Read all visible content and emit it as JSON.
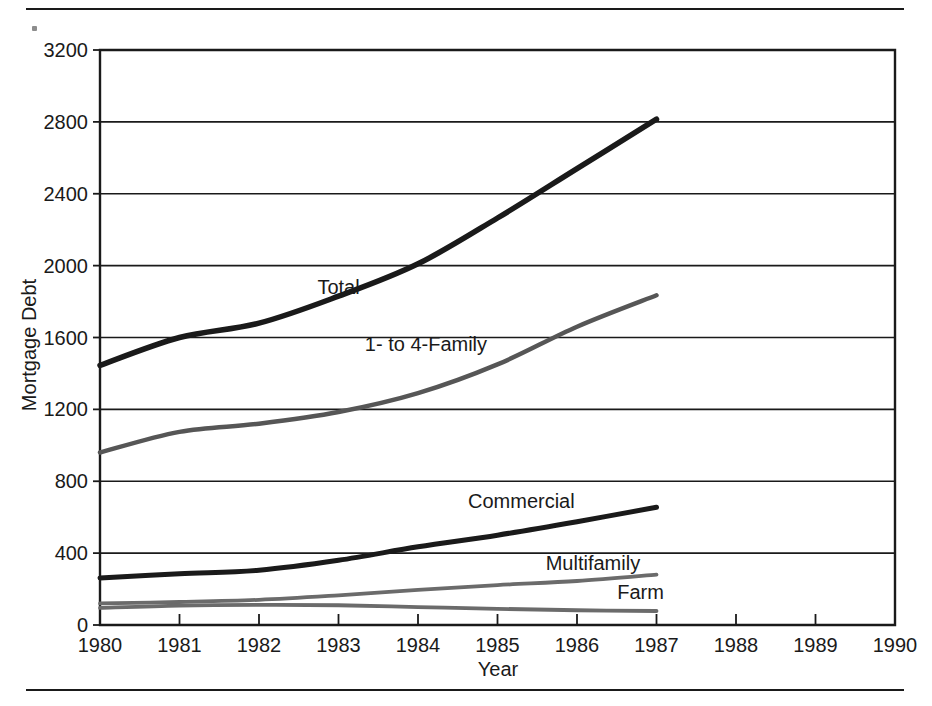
{
  "figure": {
    "rule_top": "horizontal-rule",
    "rule_bottom": "horizontal-rule",
    "speck": "print-artifact-speck"
  },
  "chart_data": {
    "type": "line",
    "title": "",
    "xlabel": "Year",
    "ylabel": "Mortgage Debt",
    "xlim": [
      1980,
      1990
    ],
    "ylim": [
      0,
      3200
    ],
    "xticks": [
      1980,
      1981,
      1982,
      1983,
      1984,
      1985,
      1986,
      1987,
      1988,
      1989,
      1990
    ],
    "xtick_labels": [
      "1980",
      "1981",
      "1982",
      "1983",
      "1984",
      "1985",
      "1986",
      "1987",
      "1988",
      "1989",
      "1990"
    ],
    "yticks": [
      0,
      400,
      800,
      1200,
      1600,
      2000,
      2400,
      2800,
      3200
    ],
    "ytick_labels": [
      "0",
      "400",
      "800",
      "1200",
      "1600",
      "2000",
      "2400",
      "2800",
      "3200"
    ],
    "grid": "horizontal",
    "legend": "inline-labels",
    "x": [
      1980,
      1981,
      1982,
      1983,
      1984,
      1985,
      1986,
      1987
    ],
    "series": [
      {
        "name": "Total",
        "label": "Total",
        "color": "#1a1a1a",
        "width": 5.5,
        "values": [
          1445,
          1600,
          1680,
          1830,
          2010,
          2265,
          2540,
          2815
        ],
        "label_x": 1983.0,
        "label_y": 1880
      },
      {
        "name": "1- to 4-Family",
        "label": "1- to 4-Family",
        "color": "#565656",
        "width": 4.5,
        "values": [
          960,
          1075,
          1120,
          1185,
          1290,
          1450,
          1660,
          1835
        ],
        "label_x": 1984.1,
        "label_y": 1565
      },
      {
        "name": "Commercial",
        "label": "Commercial",
        "color": "#1a1a1a",
        "width": 5.0,
        "values": [
          262,
          285,
          305,
          360,
          435,
          500,
          575,
          655
        ],
        "label_x": 1985.3,
        "label_y": 690
      },
      {
        "name": "Multifamily",
        "label": "Multifamily",
        "color": "#6b6b6b",
        "width": 3.8,
        "values": [
          120,
          128,
          140,
          165,
          195,
          222,
          245,
          280
        ],
        "label_x": 1986.2,
        "label_y": 345
      },
      {
        "name": "Farm",
        "label": "Farm",
        "color": "#6b6b6b",
        "width": 3.8,
        "values": [
          95,
          108,
          112,
          110,
          100,
          90,
          82,
          78
        ],
        "label_x": 1986.8,
        "label_y": 185
      }
    ]
  }
}
